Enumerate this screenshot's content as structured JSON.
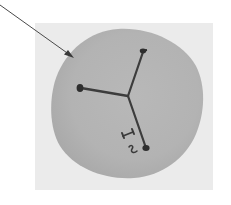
{
  "image": {
    "description": "Grayscale photo of a round disc with three ink-drawn arms radiating from a central junction, with handwritten marks near the lower arm, and a pointer arrow indicating the disc edge",
    "handwritten_marks": [
      "I",
      "S"
    ],
    "colors": {
      "page_background": "#ffffff",
      "photo_background": "#ebebeb",
      "disc": "#b4b4b4",
      "ink": "#3a3a3a",
      "pointer_arrow": "#4a4a4a"
    }
  }
}
